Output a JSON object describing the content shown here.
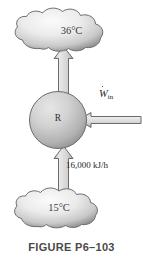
{
  "figure": {
    "caption": "FIGURE P6–103",
    "hot_reservoir": {
      "label": "36°C",
      "shape": "cloud-icon"
    },
    "cold_reservoir": {
      "label": "15°C",
      "shape": "cloud-icon"
    },
    "device": {
      "label": "R",
      "shape": "circle-icon"
    },
    "heat_input": {
      "label": "16,000 kJ/h",
      "arrow": "arrow-up-icon"
    },
    "heat_output": {
      "label": "",
      "arrow": "arrow-up-icon"
    },
    "work_input": {
      "symbol": "W",
      "subscript": "in",
      "arrow": "arrow-left-icon"
    },
    "colors": {
      "background": "#ffffff",
      "outline": "#4a4a4a",
      "fill_light": "#f2f2f2",
      "fill_mid": "#d4d4d4",
      "fill_dark": "#8d8d8d",
      "text": "#2b2b2b",
      "caption_text": "#4a4a4a"
    }
  }
}
